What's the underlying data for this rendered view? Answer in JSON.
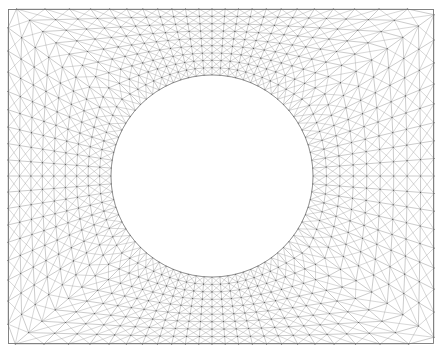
{
  "figure": {
    "kind": "finite-element-mesh",
    "background_color": "#ffffff",
    "canvas": {
      "width": 444,
      "height": 351
    }
  },
  "chart_data": {
    "type": "mesh",
    "subtitle": "",
    "xlabel": "",
    "ylabel": "",
    "grid": false,
    "legend": "none",
    "annotations": [],
    "domain": {
      "outer_shape": "rectangle",
      "inner_shape": "circle",
      "outer_rect": {
        "x": 8,
        "y": 9,
        "width": 426,
        "height": 335
      },
      "inner_circle": {
        "cx": 212,
        "cy": 176,
        "r": 101
      }
    },
    "mesh": {
      "topology": "mapped transfinite O-grid, each quad split by both diagonals into 4 triangles",
      "radial_layers": 9,
      "circumferential_divisions": 80,
      "radial_grading": 1.0,
      "node_count_estimate": 800,
      "triangle_count_estimate": 2880,
      "element_type": "triangle"
    },
    "style": {
      "edge_color": "#8a8a8a",
      "edge_width": 0.45,
      "diagonal_color": "#9a9a9a",
      "diagonal_width": 0.4,
      "node_color": "#555555",
      "node_radius": 0.55,
      "boundary_color": "#777777",
      "boundary_width": 0.9,
      "hole_fill": "#ffffff",
      "background": "#ffffff"
    }
  }
}
